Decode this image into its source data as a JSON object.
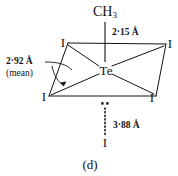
{
  "figure": {
    "caption": "(d)",
    "apex_group": "CH",
    "apex_group_sub": "3",
    "center_atom": "Te",
    "equatorial_atoms": [
      {
        "label": "I",
        "position": "top-left"
      },
      {
        "label": "I",
        "position": "top-right"
      },
      {
        "label": "I",
        "position": "bottom-left"
      },
      {
        "label": "I",
        "position": "bottom-right"
      }
    ],
    "axial_contact_atom": "I",
    "labels": {
      "apex_bond": "2·15 Å",
      "equatorial_bond": "2·92 Å",
      "equatorial_bond_qualifier": "(mean)",
      "axial_contact": "3·88 Å"
    },
    "colors": {
      "ink": "#111111",
      "background": "#ffffff"
    }
  }
}
